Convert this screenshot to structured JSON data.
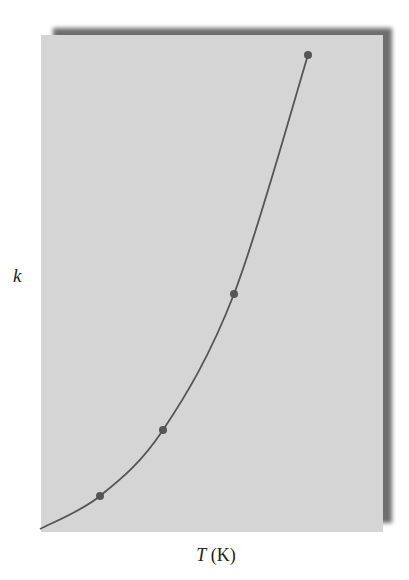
{
  "chart_data": {
    "type": "line",
    "title": "",
    "xlabel_var": "T",
    "xlabel_unit": "(K)",
    "xlabel": "T (K)",
    "ylabel": "k",
    "grid": false,
    "legend": null,
    "points_px": [
      {
        "x": 100,
        "y": 496
      },
      {
        "x": 163,
        "y": 430
      },
      {
        "x": 234,
        "y": 294
      },
      {
        "x": 308,
        "y": 55
      }
    ],
    "curve_start_px": {
      "x": 40,
      "y": 529
    },
    "colors": {
      "panel": "#d5d5d5",
      "curve": "#555555",
      "points": "#555555",
      "shadow": "#6e6e6e"
    }
  }
}
